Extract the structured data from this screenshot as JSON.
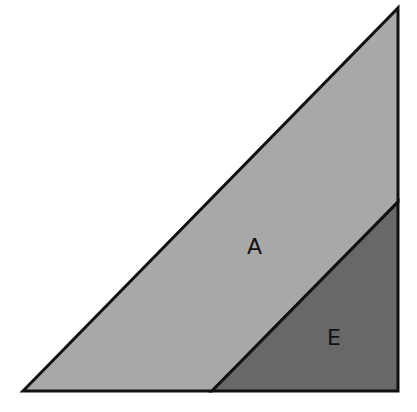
{
  "diagram": {
    "type": "geometric-figure",
    "colors": {
      "background": "#ffffff",
      "region_A": "#a8a8a8",
      "region_E": "#686868",
      "stroke": "#111111"
    },
    "regions": [
      {
        "label": "A",
        "shape": "trapezoid"
      },
      {
        "label": "E",
        "shape": "right-triangle"
      }
    ]
  }
}
